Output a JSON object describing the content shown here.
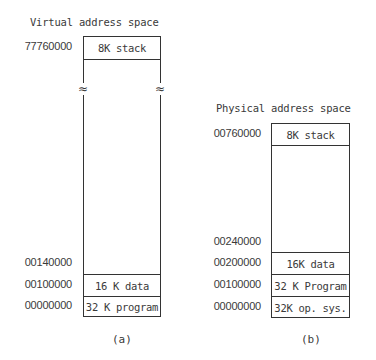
{
  "figure_a": {
    "title": "Virtual address space",
    "caption": "(a)",
    "break_symbol": "≈",
    "segments": [
      {
        "label": "8K stack",
        "address": "77760000"
      },
      {
        "label": "",
        "address": "00140000"
      },
      {
        "label": "16 K data",
        "address": "00100000"
      },
      {
        "label": "32 K program",
        "address": "00000000"
      }
    ]
  },
  "figure_b": {
    "title": "Physical address space",
    "caption": "(b)",
    "segments": [
      {
        "label": "8K stack",
        "address": "00760000"
      },
      {
        "label": "",
        "address": "00240000"
      },
      {
        "label": "16K data",
        "address": "00200000"
      },
      {
        "label": "32 K Program",
        "address": "00100000"
      },
      {
        "label": "32K op. sys.",
        "address": "00000000"
      }
    ]
  }
}
